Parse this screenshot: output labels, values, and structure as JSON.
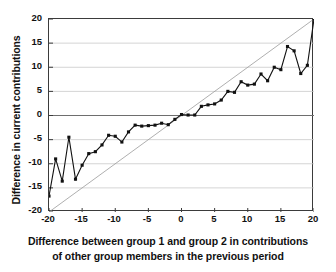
{
  "chart_data": {
    "type": "line",
    "title": "",
    "xlabel": "Difference between group 1 and group 2 in contributions of other group members in the previous period",
    "xlabel_line1": "Difference between group 1 and group 2 in contributions",
    "xlabel_line2": "of other group members in the previous period",
    "ylabel": "Difference in current contributions",
    "xlim": [
      -20,
      20
    ],
    "ylim": [
      -20,
      20
    ],
    "xticks": [
      -20,
      -15,
      -10,
      -5,
      0,
      5,
      10,
      15,
      20
    ],
    "yticks": [
      -20,
      -15,
      -10,
      -5,
      0,
      5,
      10,
      15,
      20
    ],
    "xticklabels": [
      "-20",
      "-15",
      "-10",
      "-5",
      "0",
      "5",
      "10",
      "15",
      "20"
    ],
    "yticklabels": [
      "-20",
      "-15",
      "-10",
      "-5",
      "0",
      "5",
      "10",
      "15",
      "20"
    ],
    "grid": true,
    "grid_axis": "y",
    "legend": false,
    "legend_position": "none",
    "marker": "square",
    "marker_color": "#111111",
    "line_color": "#111111",
    "reference_line": {
      "name": "45-degree identity line",
      "from": [
        -20,
        -20
      ],
      "to": [
        20,
        20
      ],
      "color": "#9a9a9a",
      "style": "thin-solid"
    },
    "x": [
      -20,
      -19,
      -18,
      -17,
      -16,
      -15,
      -14,
      -13,
      -12,
      -11,
      -10,
      -9,
      -8,
      -7,
      -6,
      -5,
      -4,
      -3,
      -2,
      -1,
      0,
      1,
      2,
      3,
      4,
      5,
      6,
      7,
      8,
      9,
      10,
      11,
      12,
      13,
      14,
      15,
      16,
      17,
      18,
      19,
      20
    ],
    "y": [
      -16.7,
      -9.0,
      -13.6,
      -4.5,
      -13.2,
      -10.3,
      -7.9,
      -7.5,
      -6.1,
      -4.1,
      -4.3,
      -5.5,
      -3.4,
      -2.0,
      -2.2,
      -2.1,
      -2.0,
      -1.6,
      -1.9,
      -0.8,
      0.2,
      0.1,
      0.1,
      1.9,
      2.2,
      2.4,
      3.2,
      5.0,
      4.8,
      7.0,
      6.3,
      6.5,
      8.6,
      7.2,
      10.0,
      9.5,
      14.3,
      13.4,
      8.7,
      10.4,
      20.0
    ],
    "series": [
      {
        "name": "Difference in current contributions",
        "values": [
          -16.7,
          -9.0,
          -13.6,
          -4.5,
          -13.2,
          -10.3,
          -7.9,
          -7.5,
          -6.1,
          -4.1,
          -4.3,
          -5.5,
          -3.4,
          -2.0,
          -2.2,
          -2.1,
          -2.0,
          -1.6,
          -1.9,
          -0.8,
          0.2,
          0.1,
          0.1,
          1.9,
          2.2,
          2.4,
          3.2,
          5.0,
          4.8,
          7.0,
          6.3,
          6.5,
          8.6,
          7.2,
          10.0,
          9.5,
          14.3,
          13.4,
          8.7,
          10.4,
          20.0
        ]
      }
    ],
    "colors": {
      "axis": "#3b3b3b",
      "grid": "#c9c9c9",
      "zero_line": "#6e6e6e",
      "data": "#111111",
      "reference": "#9a9a9a",
      "background": "#ffffff",
      "text": "#111111"
    }
  }
}
